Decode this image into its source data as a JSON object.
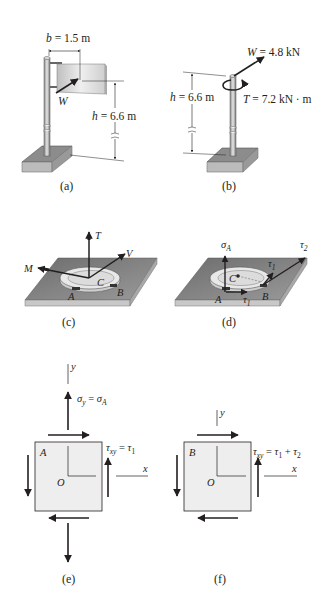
{
  "figure": {
    "panels": {
      "a": {
        "caption": "(a)",
        "b_label": "b = 1.5 m",
        "h_label": "h = 6.6 m",
        "w_label": "W"
      },
      "b": {
        "caption": "(b)",
        "w_label": "W = 4.8 kN",
        "t_label": "T = 7.2 kN · m",
        "h_label": "h = 6.6 m"
      },
      "c": {
        "caption": "(c)",
        "labels": {
          "T": "T",
          "V": "V",
          "M": "M",
          "C": "C",
          "A": "A",
          "B": "B"
        }
      },
      "d": {
        "caption": "(d)",
        "labels": {
          "sigma": "σ",
          "sigma_sub": "A",
          "tau2": "τ",
          "tau2_sub": "2",
          "tau1": "τ",
          "tau1_sub": "1",
          "tau1b": "τ",
          "tau1b_sub": "1",
          "C": "C",
          "A": "A",
          "B": "B"
        }
      },
      "e": {
        "caption": "(e)",
        "point": "A",
        "origin": "O",
        "x_axis": "x",
        "y_axis": "y",
        "sigma_eq": "σy = σA",
        "tau_eq": "τxy = τ1"
      },
      "f": {
        "caption": "(f)",
        "point": "B",
        "origin": "O",
        "x_axis": "x",
        "y_axis": "y",
        "tau_eq": "τxy = τ1 + τ2"
      }
    },
    "colors": {
      "ink": "#231f20",
      "element_fill": "#eeeeee",
      "base_dark": "#7a7a7a",
      "base_light": "#bdbdbd"
    }
  }
}
